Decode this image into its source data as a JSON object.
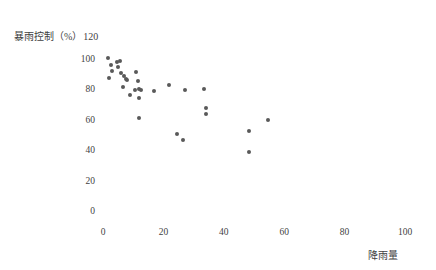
{
  "chart_data": {
    "type": "scatter",
    "title": "",
    "subtitle": "",
    "ylabel": "暴雨控制（%）",
    "xlabel": "降雨量",
    "y_top_value": "120",
    "xlim": [
      0,
      100
    ],
    "ylim": [
      0,
      120
    ],
    "xticks": [
      "0",
      "20",
      "40",
      "60",
      "80",
      "100"
    ],
    "xtick_values": [
      0,
      20,
      40,
      60,
      80,
      100
    ],
    "yticks": [
      "0",
      "20",
      "40",
      "60",
      "80",
      "100"
    ],
    "ytick_values": [
      0,
      20,
      40,
      60,
      80,
      100
    ],
    "grid": false,
    "legend": null,
    "marker_color": "#595959",
    "marker_size": 4,
    "series": [
      {
        "name": "暴雨控制率",
        "points": [
          [
            1.5,
            100.5
          ],
          [
            2.5,
            96.0
          ],
          [
            3.0,
            92.0
          ],
          [
            2.0,
            87.5
          ],
          [
            4.5,
            98.0
          ],
          [
            5.0,
            94.5
          ],
          [
            5.5,
            99.0
          ],
          [
            6.0,
            90.5
          ],
          [
            7.0,
            88.5
          ],
          [
            7.5,
            87.0
          ],
          [
            8.0,
            86.0
          ],
          [
            6.5,
            81.5
          ],
          [
            10.5,
            79.5
          ],
          [
            11.0,
            91.5
          ],
          [
            11.5,
            85.5
          ],
          [
            12.0,
            80.5
          ],
          [
            12.5,
            79.5
          ],
          [
            12.0,
            74.5
          ],
          [
            9.0,
            76.0
          ],
          [
            11.8,
            61.5
          ],
          [
            17.0,
            79.0
          ],
          [
            22.0,
            83.0
          ],
          [
            27.0,
            79.5
          ],
          [
            24.5,
            50.5
          ],
          [
            26.5,
            47.0
          ],
          [
            34.0,
            67.5
          ],
          [
            34.2,
            63.5
          ],
          [
            33.5,
            80.0
          ],
          [
            48.5,
            52.5
          ],
          [
            48.5,
            39.0
          ],
          [
            54.5,
            60.0
          ]
        ]
      }
    ]
  },
  "axes_geometry": {
    "x0_px": 103,
    "x_scale_px_per_unit": 3.02,
    "y0_px": 211,
    "y_scale_px_per_unit": 1.52
  }
}
